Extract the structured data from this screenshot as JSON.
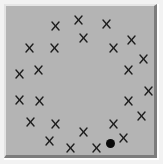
{
  "panel": {
    "background_color": "#b4b4b4",
    "border_light": "#e6e6e6",
    "border_dark": "#7c7c7c",
    "mark_color": "#1e1e1e",
    "dot_color": "#0a0a0a"
  },
  "marks": [
    {
      "symbol": "X",
      "x": 55,
      "y": 26
    },
    {
      "symbol": "X",
      "x": 78,
      "y": 20
    },
    {
      "symbol": "X",
      "x": 106,
      "y": 24
    },
    {
      "symbol": "X",
      "x": 83,
      "y": 38
    },
    {
      "symbol": "X",
      "x": 131,
      "y": 40
    },
    {
      "symbol": "X",
      "x": 29,
      "y": 48
    },
    {
      "symbol": "X",
      "x": 54,
      "y": 48
    },
    {
      "symbol": "X",
      "x": 113,
      "y": 48
    },
    {
      "symbol": "X",
      "x": 143,
      "y": 59
    },
    {
      "symbol": "X",
      "x": 38,
      "y": 70
    },
    {
      "symbol": "X",
      "x": 19,
      "y": 74
    },
    {
      "symbol": "X",
      "x": 128,
      "y": 70
    },
    {
      "symbol": "X",
      "x": 148,
      "y": 91
    },
    {
      "symbol": "X",
      "x": 19,
      "y": 100
    },
    {
      "symbol": "X",
      "x": 39,
      "y": 101
    },
    {
      "symbol": "X",
      "x": 128,
      "y": 101
    },
    {
      "symbol": "X",
      "x": 30,
      "y": 122
    },
    {
      "symbol": "X",
      "x": 55,
      "y": 124
    },
    {
      "symbol": "X",
      "x": 113,
      "y": 124
    },
    {
      "symbol": "X",
      "x": 141,
      "y": 116
    },
    {
      "symbol": "X",
      "x": 83,
      "y": 132
    },
    {
      "symbol": "X",
      "x": 49,
      "y": 141
    },
    {
      "symbol": "X",
      "x": 123,
      "y": 138
    },
    {
      "symbol": "X",
      "x": 70,
      "y": 148
    },
    {
      "symbol": "X",
      "x": 96,
      "y": 148
    }
  ],
  "dot": {
    "x": 110,
    "y": 143
  }
}
